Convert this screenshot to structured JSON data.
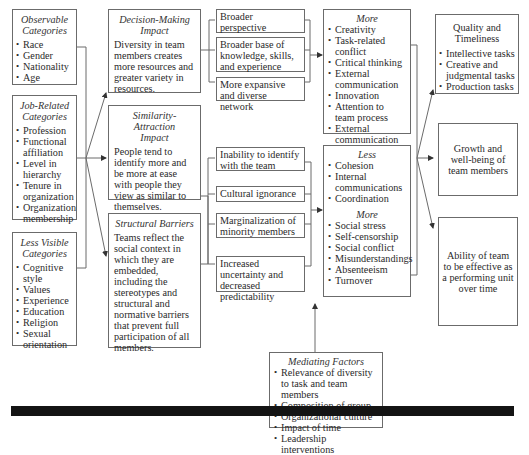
{
  "inputs": {
    "observable": {
      "title": "Observable Categories",
      "title_lines": [
        "Observable",
        "Categories"
      ],
      "items": [
        "Race",
        "Gender",
        "Nationality",
        "Age"
      ]
    },
    "job_related": {
      "title": "Job-Related Categories",
      "title_lines": [
        "Job-Related",
        "Categories"
      ],
      "items": [
        "Profession",
        "Functional affiliation",
        "Level in hierarchy",
        "Tenure in organization",
        "Organization membership"
      ]
    },
    "less_visible": {
      "title": "Less Visible Categories",
      "title_lines": [
        "Less Visible",
        "Categories"
      ],
      "items": [
        "Cognitive style",
        "Values",
        "Experience",
        "Education",
        "Religion",
        "Sexual orientation"
      ]
    }
  },
  "impacts": {
    "decision_making": {
      "title": "Decision-Making Impact",
      "title_lines": [
        "Decision-Making",
        "Impact"
      ],
      "text": "Diversity in team members creates more resources and greater variety in resources."
    },
    "similarity_attraction": {
      "title": "Similarity-Attraction Impact",
      "title_lines": [
        "Similarity-Attraction",
        "Impact"
      ],
      "text": "People tend to identify more and be more at ease with people they view as similar to themselves."
    },
    "structural_barriers": {
      "title": "Structural Barriers",
      "text": "Teams reflect the social context in which they are embedded, including the stereotypes and structural and normative barriers that prevent full participation of all members."
    }
  },
  "effects": {
    "positive": [
      "Broader perspective",
      "Broader base of knowledge, skills, and experience",
      "More expansive and diverse network"
    ],
    "negative": [
      "Inability to identify with the team",
      "Cultural ignorance",
      "Marginalization of minority members",
      "Increased uncertainty and decreased predictability"
    ]
  },
  "processes": {
    "more_positive": {
      "title": "More",
      "items": [
        "Creativity",
        "Task-related conflict",
        "Critical thinking",
        "External communication",
        "Innovation",
        "Attention to team process",
        "External communication",
        "Learning"
      ]
    },
    "less": {
      "title": "Less",
      "items": [
        "Cohesion",
        "Internal communications",
        "Coordination"
      ]
    },
    "more_negative": {
      "title": "More",
      "items": [
        "Social stress",
        "Self-censorship",
        "Social conflict",
        "Misunderstandings",
        "Absenteeism",
        "Turnover"
      ]
    }
  },
  "mediating": {
    "title": "Mediating Factors",
    "items": [
      "Relevance of diversity to task and team members",
      "Composition of group",
      "Organizational culture",
      "Impact of time",
      "Leadership interventions"
    ]
  },
  "outcomes": {
    "quality": {
      "title": "Quality and Timeliness",
      "title_lines": [
        "Quality and",
        "Timeliness"
      ],
      "items": [
        "Intellective tasks",
        "Creative and judgmental tasks",
        "Production tasks"
      ]
    },
    "growth": {
      "text": "Growth and well-being of team members"
    },
    "ability": {
      "text": "Ability of team to be effective as a performing unit over time"
    }
  },
  "colors": {
    "line": "#6b6b6b",
    "text": "#2a2a2a",
    "footer_bar": "#141414"
  }
}
